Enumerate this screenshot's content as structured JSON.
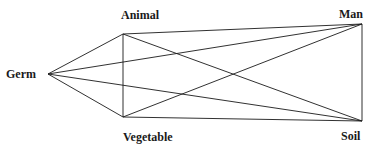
{
  "diagram": {
    "type": "complete-graph",
    "nodes": [
      {
        "id": "germ",
        "label": "Germ",
        "x": 48,
        "y": 74,
        "label_x": 6,
        "label_y": 68
      },
      {
        "id": "animal",
        "label": "Animal",
        "x": 123,
        "y": 34,
        "label_x": 121,
        "label_y": 9
      },
      {
        "id": "vegetable",
        "label": "Vegetable",
        "x": 123,
        "y": 117,
        "label_x": 123,
        "label_y": 131
      },
      {
        "id": "man",
        "label": "Man",
        "x": 362,
        "y": 24,
        "label_x": 339,
        "label_y": 8
      },
      {
        "id": "soil",
        "label": "Soil",
        "x": 362,
        "y": 121,
        "label_x": 341,
        "label_y": 130
      }
    ],
    "edges": [
      [
        "germ",
        "animal"
      ],
      [
        "germ",
        "vegetable"
      ],
      [
        "germ",
        "man"
      ],
      [
        "germ",
        "soil"
      ],
      [
        "animal",
        "vegetable"
      ],
      [
        "animal",
        "man"
      ],
      [
        "animal",
        "soil"
      ],
      [
        "vegetable",
        "man"
      ],
      [
        "vegetable",
        "soil"
      ],
      [
        "man",
        "soil"
      ]
    ],
    "line_color": "#1a1a1a"
  }
}
